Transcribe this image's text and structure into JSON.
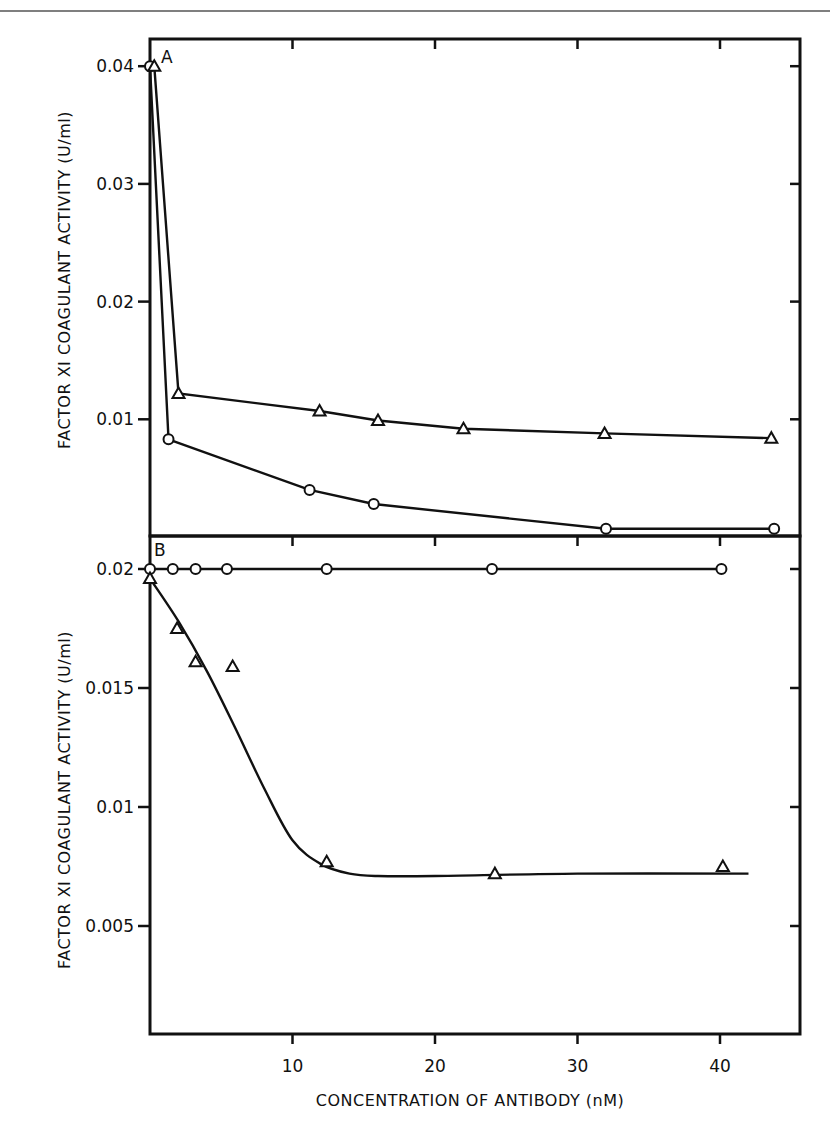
{
  "figure": {
    "x_axis_title": "CONCENTRATION OF ANTIBODY (nM)",
    "y_axis_title": "FACTOR XI COAGULANT ACTIVITY (U/ml)",
    "panel_a_letter": "A",
    "panel_b_letter": "B"
  },
  "chart_data": [
    {
      "type": "line",
      "panel": "A",
      "title": "",
      "xlabel": "CONCENTRATION OF ANTIBODY (nM)",
      "ylabel": "FACTOR XI COAGULANT ACTIVITY (U/ml)",
      "xlim": [
        0,
        45.6
      ],
      "ylim": [
        0,
        0.0402
      ],
      "x_ticks": [
        10,
        20,
        30,
        40
      ],
      "y_ticks": [
        0.01,
        0.02,
        0.03,
        0.04
      ],
      "y_tick_labels": [
        "0.01",
        "0.02",
        "0.03",
        "0.04"
      ],
      "grid": false,
      "legend": null,
      "series": [
        {
          "name": "open circles",
          "marker": "circle",
          "x": [
            0,
            1.3,
            11.2,
            15.7,
            32.0,
            43.8
          ],
          "y": [
            0.04,
            0.0083,
            0.004,
            0.0028,
            0.0007,
            0.0007
          ]
        },
        {
          "name": "open triangles",
          "marker": "triangle",
          "x": [
            0.3,
            2.0,
            11.9,
            16.0,
            22.0,
            31.9,
            43.6
          ],
          "y": [
            0.04,
            0.0122,
            0.0107,
            0.0099,
            0.0092,
            0.0088,
            0.0084
          ]
        }
      ]
    },
    {
      "type": "line",
      "panel": "B",
      "title": "",
      "xlabel": "CONCENTRATION OF ANTIBODY (nM)",
      "ylabel": "FACTOR XI COAGULANT ACTIVITY (U/ml)",
      "xlim": [
        0,
        45.6
      ],
      "ylim": [
        0,
        0.0213
      ],
      "x_ticks": [
        10,
        20,
        30,
        40
      ],
      "x_tick_labels": [
        "10",
        "20",
        "30",
        "40"
      ],
      "y_ticks": [
        0.005,
        0.01,
        0.015,
        0.02
      ],
      "y_tick_labels": [
        "0.005",
        "0.01",
        "0.015",
        "0.02"
      ],
      "grid": false,
      "legend": null,
      "series": [
        {
          "name": "open circles",
          "marker": "circle",
          "line": "straight",
          "x": [
            0,
            1.6,
            3.2,
            5.4,
            12.4,
            24.0,
            40.1
          ],
          "y": [
            0.02,
            0.02,
            0.02,
            0.02,
            0.02,
            0.02,
            0.02
          ]
        },
        {
          "name": "open triangles",
          "marker": "triangle",
          "line": "smooth fitted curve",
          "x": [
            0,
            1.9,
            3.2,
            5.8,
            12.4,
            24.2,
            40.2
          ],
          "y": [
            0.0196,
            0.0175,
            0.0161,
            0.0159,
            0.0077,
            0.0072,
            0.0075
          ],
          "curve_x": [
            0,
            2,
            4,
            6,
            8,
            10,
            12,
            14,
            16,
            20,
            30,
            42
          ],
          "curve_y": [
            0.0196,
            0.0178,
            0.0157,
            0.0133,
            0.0108,
            0.0086,
            0.0076,
            0.0072,
            0.0071,
            0.0071,
            0.0072,
            0.0072
          ]
        }
      ]
    }
  ]
}
